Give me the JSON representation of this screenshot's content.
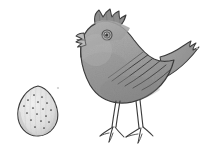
{
  "canvas": {
    "width": 205,
    "height": 162,
    "background_color": "#ffffff",
    "medium": "pencil-sketch",
    "title": "Pencil sketch of a speckled egg and a grey chick"
  },
  "palette": {
    "background": "#ffffff",
    "outline": "#3b3b3b",
    "body_fill_light": "#b4b4b4",
    "body_fill_mid": "#a0a0a0",
    "body_fill_dark": "#8a8a8a",
    "head_fill": "#a8a8a8",
    "comb_fill": "#8f8f8f",
    "beak_fill": "#bdbdbd",
    "eye_ring": "#555555",
    "eye_pupil": "#3a3a3a",
    "leg_fill": "#b8b8b8",
    "tail_fill": "#9a9a9a",
    "egg_fill": "#e6e6e6",
    "egg_shade": "#cfcfcf",
    "egg_speck": "#4a4a4a",
    "egg_stripe": "#c8c8c8",
    "stray_mark": "#cccccc"
  },
  "objects": [
    {
      "id": "egg",
      "label": "Speckled egg",
      "kind": "egg",
      "bbox": {
        "x": 18,
        "y": 86,
        "width": 40,
        "height": 50
      },
      "fill_color": "#e6e6e6",
      "outline_color": "#3b3b3b",
      "speckle_color": "#4a4a4a",
      "speckle_count": 17,
      "speckles": [
        {
          "x": 34,
          "y": 95
        },
        {
          "x": 42,
          "y": 97
        },
        {
          "x": 28,
          "y": 100
        },
        {
          "x": 38,
          "y": 102
        },
        {
          "x": 47,
          "y": 103
        },
        {
          "x": 24,
          "y": 106
        },
        {
          "x": 33,
          "y": 108
        },
        {
          "x": 43,
          "y": 109
        },
        {
          "x": 51,
          "y": 110
        },
        {
          "x": 27,
          "y": 113
        },
        {
          "x": 37,
          "y": 114
        },
        {
          "x": 46,
          "y": 116
        },
        {
          "x": 31,
          "y": 120
        },
        {
          "x": 41,
          "y": 121
        },
        {
          "x": 49,
          "y": 122
        },
        {
          "x": 35,
          "y": 127
        },
        {
          "x": 44,
          "y": 128
        }
      ],
      "stripe_count": 7,
      "pointed_end": "top"
    },
    {
      "id": "chick",
      "label": "Grey chick facing left",
      "kind": "bird",
      "bbox": {
        "x": 76,
        "y": 8,
        "width": 122,
        "height": 137
      },
      "facing": "left",
      "body_fill_color": "#a0a0a0",
      "outline_color": "#3b3b3b",
      "parts": [
        {
          "id": "comb",
          "label": "Comb / crest",
          "fill": "#8f8f8f",
          "spike_count": 4
        },
        {
          "id": "head",
          "label": "Head",
          "fill": "#a8a8a8"
        },
        {
          "id": "beak",
          "label": "Open beak",
          "fill": "#bdbdbd",
          "state": "open"
        },
        {
          "id": "eye",
          "label": "Eye",
          "ring_color": "#555555",
          "pupil_color": "#3a3a3a",
          "cx": 107,
          "cy": 35,
          "r": 5
        },
        {
          "id": "body",
          "label": "Body",
          "fill": "#a0a0a0"
        },
        {
          "id": "wing",
          "label": "Wing",
          "fill": "#9a9a9a",
          "feather_line_count": 5
        },
        {
          "id": "tail",
          "label": "Tail",
          "fill": "#9a9a9a",
          "feather_point_count": 3
        },
        {
          "id": "leg-left",
          "label": "Left leg",
          "fill": "#b8b8b8",
          "toe_count": 3
        },
        {
          "id": "leg-right",
          "label": "Right leg",
          "fill": "#b8b8b8",
          "toe_count": 3
        }
      ]
    }
  ],
  "annotations": {
    "stray_marks": [
      {
        "id": "stray-dot-upper",
        "x": 58,
        "y": 88,
        "color": "#cccccc"
      },
      {
        "id": "stray-dot-right",
        "x": 197,
        "y": 48,
        "color": "#d4d4d4"
      }
    ]
  }
}
